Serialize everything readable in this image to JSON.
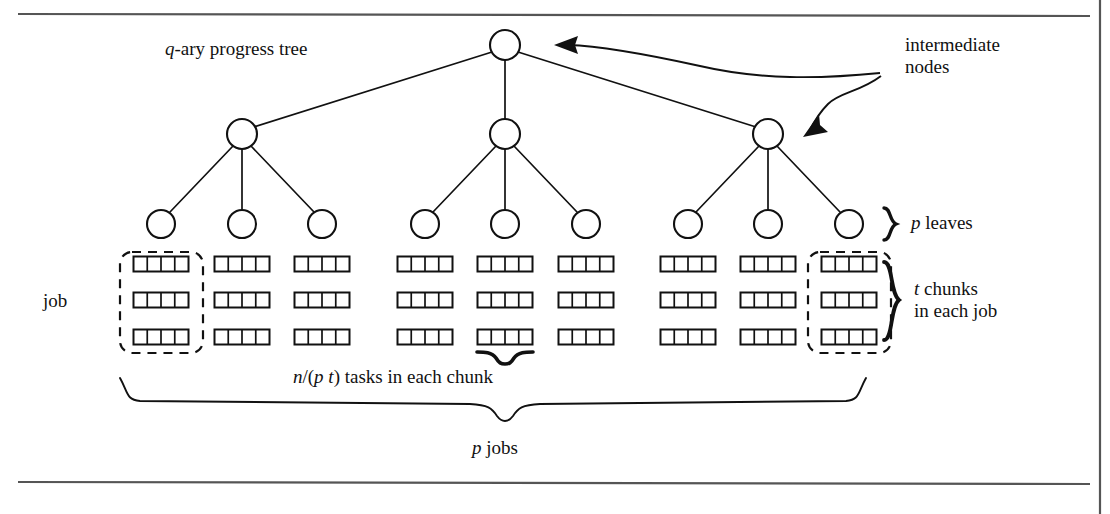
{
  "figure": {
    "type": "diagram",
    "background_color": "#ffffff",
    "line_color": "#111111",
    "frame": {
      "top_rule": true,
      "bottom_rule": true,
      "right_rule": true
    }
  },
  "labels": {
    "tree_title_prefix": "q",
    "tree_title_rest": "-ary progress tree",
    "intermediate_nodes_line1": "intermediate",
    "intermediate_nodes_line2": "nodes",
    "p_leaves_prefix": "p",
    "p_leaves_rest": " leaves",
    "job": "job",
    "t_chunks_prefix": "t",
    "t_chunks_rest": " chunks",
    "t_chunks_line2": "in each job",
    "tasks_prefix": "n",
    "tasks_mid": "/(",
    "tasks_p": "p",
    "tasks_space": " ",
    "tasks_t": "t",
    "tasks_rest": ") tasks in each chunk",
    "p_jobs_prefix": "p",
    "p_jobs_rest": " jobs"
  },
  "tree": {
    "root": {
      "cx": 505,
      "cy": 45,
      "r": 15
    },
    "intermediate": [
      {
        "cx": 242,
        "cy": 134,
        "r": 15
      },
      {
        "cx": 505,
        "cy": 134,
        "r": 15
      },
      {
        "cx": 768,
        "cy": 134,
        "r": 15
      }
    ],
    "leaves": [
      {
        "cx": 161,
        "cy": 224,
        "r": 14
      },
      {
        "cx": 242,
        "cy": 224,
        "r": 14
      },
      {
        "cx": 322,
        "cy": 224,
        "r": 14
      },
      {
        "cx": 425,
        "cy": 224,
        "r": 14
      },
      {
        "cx": 505,
        "cy": 224,
        "r": 14
      },
      {
        "cx": 586,
        "cy": 224,
        "r": 14
      },
      {
        "cx": 688,
        "cy": 224,
        "r": 14
      },
      {
        "cx": 768,
        "cy": 224,
        "r": 14
      },
      {
        "cx": 849,
        "cy": 224,
        "r": 14
      }
    ],
    "branching_factor_symbol": "q",
    "leaf_count_symbol": "p",
    "levels": 3
  },
  "jobs": {
    "count": 9,
    "chunks_per_job": 3,
    "tasks_per_chunk": 4,
    "centers_x": [
      161,
      242,
      322,
      425,
      505,
      586,
      688,
      768,
      849
    ],
    "rows_y": [
      264,
      300,
      337
    ],
    "chunk_width": 55,
    "chunk_height": 15,
    "highlighted_jobs": [
      0,
      8
    ]
  },
  "annotations": {
    "arrow_to_root": {
      "from_x": 880,
      "from_y": 72,
      "to_x": 556,
      "to_y": 45
    },
    "arrow_to_intermediate": {
      "from_x": 880,
      "from_y": 74,
      "to_x": 802,
      "to_y": 133
    },
    "brace_p_leaves": {
      "x": 884,
      "y": 224
    },
    "brace_t_chunks": {
      "x": 884,
      "y": 300
    },
    "brace_tasks_in_chunk": {
      "x_from": 477,
      "x_to": 533,
      "y": 352
    },
    "brace_p_jobs": {
      "x_from": 120,
      "x_to": 866,
      "y": 378
    }
  }
}
